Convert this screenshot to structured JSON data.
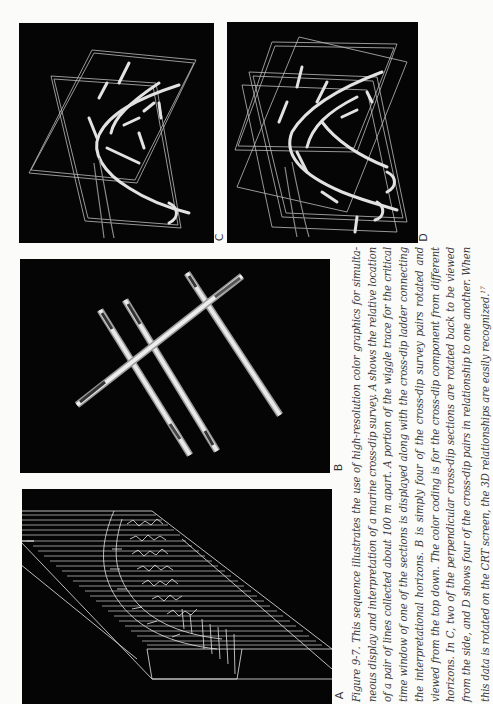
{
  "figure": {
    "number": "Figure 9-7.",
    "caption_lines": [
      "Figure 9-7. This sequence illustrates the use of high-resolution color graphics for simulta-",
      "neous display and interpretation of a marine cross-dip survey. A shows the relative location",
      "of a pair of lines collected about 100 m apart. A portion of the wiggle trace for the critical",
      "time window of one of the sections is displayed along with the cross-dip ladder connecting",
      "the interpretational horizons. B is simply four of the cross-dip survey pairs rotated and",
      "viewed from the top down. The color coding is for the cross-dip component from different",
      "horizons. In C, two of the perpendicular cross-dip sections are rotated back to be viewed",
      "from the side, and D shows four of the cross-dip pairs in relationship to one another. When",
      "this data is rotated on the CRT screen, the 3D relationships are easily recognized."
    ],
    "footnote_ref": "17",
    "orientation": "rotated 90° counter-clockwise"
  },
  "panels": {
    "A": {
      "label": "A",
      "description": "3D wireframe slab with wiggle traces and cross-dip ladder"
    },
    "B": {
      "label": "B",
      "description": "Four cross-dip survey pairs viewed from the top down"
    },
    "C": {
      "label": "C",
      "description": "Two perpendicular cross-dip sections viewed from the side"
    },
    "D": {
      "label": "D",
      "description": "Four cross-dip pairs in relationship to one another"
    }
  },
  "colors": {
    "page": "#fbfbfa",
    "panel_bg": "#050505",
    "line": "#d8d8d8",
    "caption_text": "#3a3a3a"
  }
}
